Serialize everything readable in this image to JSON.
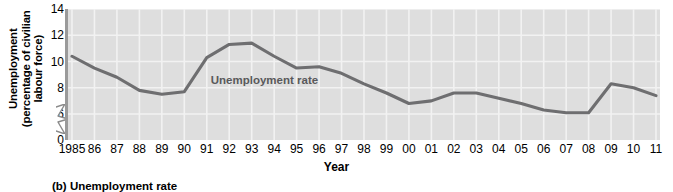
{
  "chart_data": {
    "type": "line",
    "title": "",
    "caption": "(b) Unemployment rate",
    "xlabel": "Year",
    "ylabel": "Unemployment (percentage of civilian labour force)",
    "ylabel_lines": [
      "Unemployment",
      "(percentage of civilian",
      "labour force)"
    ],
    "series_annotation": "Unemployment rate",
    "grid": true,
    "legend_position": "inline-annotation",
    "axis_break": true,
    "axis_break_between": [
      0,
      6
    ],
    "ylim": [
      6,
      14
    ],
    "yticks": [
      14,
      12,
      10,
      8,
      6,
      0
    ],
    "ytick_labels": [
      "14",
      "12",
      "10",
      "8",
      "6",
      "0"
    ],
    "categories": [
      "1985",
      "86",
      "87",
      "88",
      "89",
      "90",
      "91",
      "92",
      "93",
      "94",
      "95",
      "96",
      "97",
      "98",
      "99",
      "00",
      "01",
      "02",
      "03",
      "04",
      "05",
      "06",
      "07",
      "08",
      "09",
      "10",
      "11"
    ],
    "x": [
      1985,
      1986,
      1987,
      1988,
      1989,
      1990,
      1991,
      1992,
      1993,
      1994,
      1995,
      1996,
      1997,
      1998,
      1999,
      2000,
      2001,
      2002,
      2003,
      2004,
      2005,
      2006,
      2007,
      2008,
      2009,
      2010,
      2011
    ],
    "series": [
      {
        "name": "Unemployment rate",
        "color": "#6e6e70",
        "values": [
          10.4,
          9.5,
          8.8,
          7.8,
          7.5,
          7.7,
          10.3,
          11.3,
          11.4,
          10.4,
          9.5,
          9.6,
          9.1,
          8.3,
          7.6,
          6.8,
          7.0,
          7.6,
          7.6,
          7.2,
          6.8,
          6.3,
          6.1,
          6.1,
          8.3,
          8.0,
          7.4
        ]
      }
    ],
    "colors": {
      "plot_background": "#dedede",
      "grid": "#f2f2f2",
      "line": "#6e6e70",
      "axis": "#8a8a8a",
      "text": "#000000"
    }
  }
}
